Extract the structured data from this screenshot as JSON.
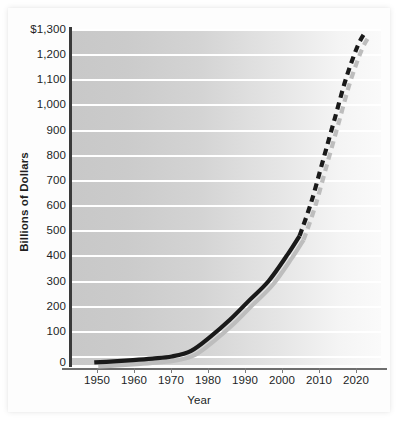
{
  "chart_data": {
    "type": "line",
    "title": "",
    "xlabel": "Year",
    "ylabel": "Billions of Dollars",
    "xlim": [
      1944,
      2024
    ],
    "ylim": [
      0,
      1300
    ],
    "grid": true,
    "legend": "none",
    "x_ticks": [
      1950,
      1960,
      1970,
      1980,
      1990,
      2000,
      2010,
      2020
    ],
    "x_tick_labels": [
      "1950",
      "1960",
      "1970",
      "1980",
      "1990",
      "2000",
      "2010",
      "2020"
    ],
    "y_ticks": [
      0,
      100,
      200,
      300,
      400,
      500,
      600,
      700,
      800,
      900,
      1000,
      1100,
      1200,
      1300
    ],
    "y_tick_labels": [
      "0",
      "100",
      "200",
      "300",
      "400",
      "500",
      "600",
      "700",
      "800",
      "900",
      "1,000",
      "1,100",
      "1,200",
      "$1,300"
    ],
    "series": [
      {
        "name": "Actual",
        "style": "solid",
        "color": "#1a1a1a",
        "x": [
          1950,
          1955,
          1960,
          1965,
          1970,
          1975,
          1980,
          1985,
          1990,
          1995,
          2000,
          2003
        ],
        "values": [
          10,
          14,
          19,
          25,
          33,
          55,
          110,
          175,
          250,
          325,
          430,
          500
        ]
      },
      {
        "name": "Projected",
        "style": "dashed",
        "color": "#1a1a1a",
        "x": [
          2003,
          2006,
          2009,
          2012,
          2015,
          2018,
          2020
        ],
        "values": [
          500,
          630,
          790,
          950,
          1110,
          1235,
          1290
        ]
      }
    ],
    "shadow": {
      "name": "drop-shadow",
      "color": "#bdbdbd",
      "offset_px": [
        4,
        4
      ]
    }
  },
  "axes": {
    "y_axis_label": "Billions of Dollars",
    "x_axis_label": "Year"
  }
}
